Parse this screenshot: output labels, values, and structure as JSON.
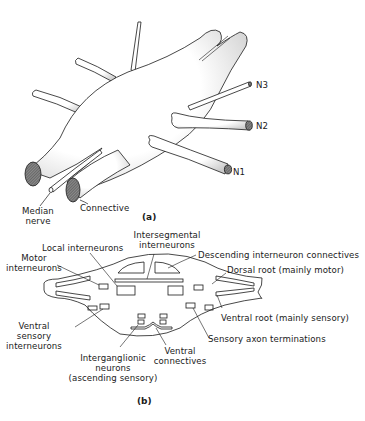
{
  "figure": {
    "panel_a": {
      "label": "(a)",
      "nerves": {
        "n1": "N1",
        "n2": "N2",
        "n3": "N3"
      },
      "median_nerve": {
        "line1": "Median",
        "line2": "nerve"
      },
      "connective": "Connective"
    },
    "panel_b": {
      "label": "(b)",
      "local_interneurons": "Local interneurons",
      "intersegmental": {
        "line1": "Intersegmental",
        "line2": "interneurons"
      },
      "motor_interneurons": {
        "line1": "Motor",
        "line2": "interneurons"
      },
      "descending_connectives": "Descending interneuron connectives",
      "dorsal_root": "Dorsal root (mainly motor)",
      "ventral_root": "Ventral root (mainly sensory)",
      "ventral_sensory": {
        "line1": "Ventral",
        "line2": "sensory",
        "line3": "interneurons"
      },
      "sensory_axon_terminations": "Sensory axon terminations",
      "interganglionic": {
        "line1": "Interganglionic",
        "line2": "neurons",
        "line3": "(ascending sensory)"
      },
      "ventral_connectives": {
        "line1": "Ventral",
        "line2": "connectives"
      }
    }
  },
  "colors": {
    "ink": "#1a1a1a",
    "stipple": "#9a9a9a",
    "hatch": "#555555"
  }
}
